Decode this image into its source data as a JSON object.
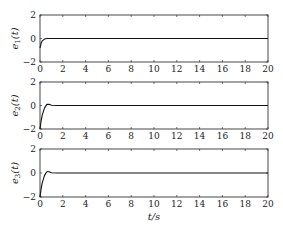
{
  "chart_data": [
    {
      "type": "line",
      "title": "",
      "ylabel": "e1(t)",
      "xlabel": "",
      "xlim": [
        0,
        20
      ],
      "ylim": [
        -2,
        2
      ],
      "xticks": [
        0,
        2,
        4,
        6,
        8,
        10,
        12,
        14,
        16,
        18,
        20
      ],
      "yticks": [
        -2,
        0,
        2
      ],
      "grid": false,
      "series": [
        {
          "name": "e1",
          "x": [
            0,
            0.1,
            0.2,
            0.4,
            0.6,
            0.8,
            1.0,
            2,
            20
          ],
          "y": [
            -0.8,
            -0.4,
            -0.2,
            -0.05,
            0.0,
            0.0,
            0.0,
            0.0,
            0.0
          ]
        }
      ]
    },
    {
      "type": "line",
      "title": "",
      "ylabel": "e2(t)",
      "xlabel": "",
      "xlim": [
        0,
        20
      ],
      "ylim": [
        -2,
        2
      ],
      "xticks": [
        0,
        2,
        4,
        6,
        8,
        10,
        12,
        14,
        16,
        18,
        20
      ],
      "yticks": [
        -2,
        0,
        2
      ],
      "grid": false,
      "series": [
        {
          "name": "e2",
          "x": [
            0,
            0.1,
            0.2,
            0.4,
            0.6,
            0.8,
            1.0,
            1.5,
            20
          ],
          "y": [
            -2.0,
            -1.3,
            -0.8,
            -0.2,
            0.1,
            0.1,
            0.02,
            0.0,
            0.0
          ]
        }
      ]
    },
    {
      "type": "line",
      "title": "",
      "ylabel": "e3(t)",
      "xlabel": "t/s",
      "xlim": [
        0,
        20
      ],
      "ylim": [
        -2,
        2
      ],
      "xticks": [
        0,
        2,
        4,
        6,
        8,
        10,
        12,
        14,
        16,
        18,
        20
      ],
      "yticks": [
        -2,
        0,
        2
      ],
      "grid": false,
      "series": [
        {
          "name": "e3",
          "x": [
            0,
            0.1,
            0.2,
            0.4,
            0.6,
            0.8,
            1.0,
            1.5,
            20
          ],
          "y": [
            -2.0,
            -1.3,
            -0.8,
            -0.2,
            0.1,
            0.1,
            0.02,
            0.0,
            0.0
          ]
        }
      ]
    }
  ],
  "labels": {
    "y1": "e",
    "y1_sub": "1",
    "y2": "e",
    "y2_sub": "2",
    "y3": "e",
    "y3_sub": "3",
    "y_suffix": "(t)",
    "xlabel": "t/s"
  }
}
